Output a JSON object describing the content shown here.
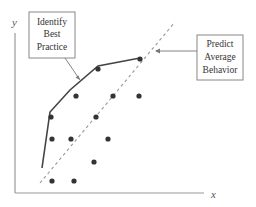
{
  "diagram": {
    "axes": {
      "x_label": "x",
      "y_label": "y"
    },
    "callouts": [
      {
        "id": "best-practice",
        "lines": [
          "Identify",
          "Best",
          "Practice"
        ]
      },
      {
        "id": "average-behavior",
        "lines": [
          "Predict",
          "Average",
          "Behavior"
        ]
      }
    ],
    "frontier_line": [
      [
        42,
        168
      ],
      [
        50,
        112
      ],
      [
        70,
        90
      ],
      [
        98,
        66
      ],
      [
        140,
        58
      ]
    ],
    "average_line": [
      [
        40,
        183
      ],
      [
        175,
        22
      ]
    ],
    "points": [
      [
        98,
        69
      ],
      [
        140,
        59
      ],
      [
        76,
        96
      ],
      [
        113,
        96
      ],
      [
        139,
        96
      ],
      [
        51,
        117
      ],
      [
        96,
        117
      ],
      [
        52,
        139
      ],
      [
        71,
        139
      ],
      [
        108,
        139
      ],
      [
        94,
        162
      ],
      [
        52,
        181
      ],
      [
        74,
        181
      ]
    ],
    "colors": {
      "line": "#444444",
      "dot": "#333333",
      "dashed": "#999999",
      "box_border": "#888888"
    }
  }
}
